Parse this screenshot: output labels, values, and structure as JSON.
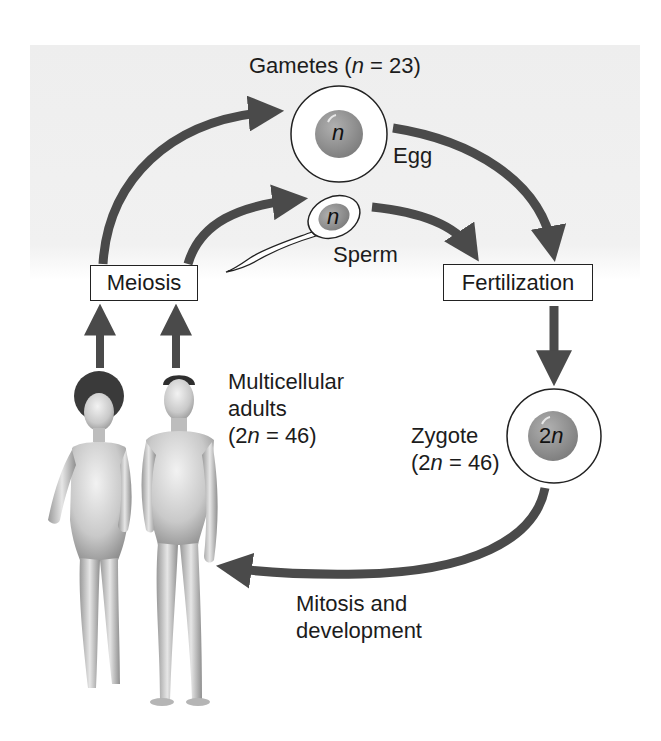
{
  "figure": {
    "colors": {
      "panel_bg": "#efefef",
      "arrow": "#4a4a4a",
      "nucleus": "#8e8e8e",
      "cell_outline": "#222222",
      "text": "#1c1c1c"
    }
  },
  "labels": {
    "gametes_prefix": "Gametes (",
    "gametes_var": "n",
    "gametes_suffix": " = 23)",
    "egg": "Egg",
    "sperm": "Sperm",
    "meiosis": "Meiosis",
    "fertilization": "Fertilization",
    "adults_line1": "Multicellular",
    "adults_line2": "adults",
    "adults_line3_prefix": "(2",
    "adults_line3_var": "n",
    "adults_line3_suffix": " = 46)",
    "zygote_line1": "Zygote",
    "zygote_line2_prefix": "(2",
    "zygote_line2_var": "n",
    "zygote_line2_suffix": " = 46)",
    "mitosis_line1": "Mitosis and",
    "mitosis_line2": "development"
  },
  "cells": {
    "egg": {
      "nucleus_label": "n",
      "ploidy": "haploid"
    },
    "sperm": {
      "nucleus_label": "n",
      "ploidy": "haploid"
    },
    "zygote": {
      "nucleus_label_prefix": "2",
      "nucleus_label_var": "n",
      "ploidy": "diploid"
    }
  },
  "stages": [
    "Multicellular adults (2n = 46)",
    "Meiosis",
    "Gametes (n = 23)",
    "Fertilization",
    "Zygote (2n = 46)",
    "Mitosis and development"
  ]
}
